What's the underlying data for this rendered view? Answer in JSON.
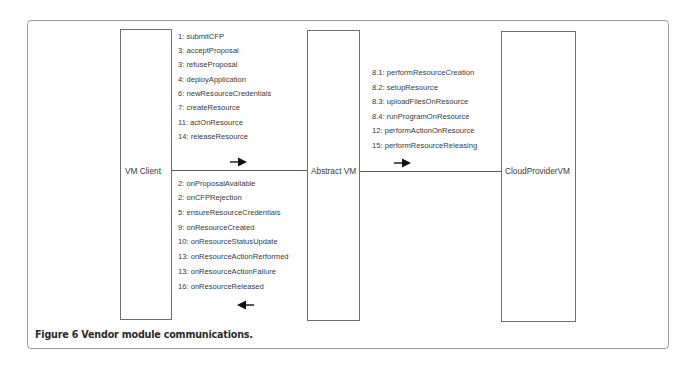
{
  "figure": {
    "caption": "Figure 6 Vendor module communications."
  },
  "components": {
    "vm_client": {
      "label": "VM Client"
    },
    "abstract_vm": {
      "label": "Abstract VM"
    },
    "cloud_provider_vm": {
      "label": "CloudProviderVM"
    }
  },
  "client_to_abstract": {
    "direction": "right",
    "messages": [
      "1: submitCFP",
      "3: acceptProposal",
      "3: refuseProposal",
      "4: deployApplication",
      "6: newResourceCredentials",
      "7: createResource",
      "11: actOnResource",
      "14: releaseResource"
    ]
  },
  "abstract_to_client": {
    "direction": "left",
    "messages": [
      "2: onProposalAvailable",
      "2: onCFPRejection",
      "5: ensureResourceCredentials",
      "9: onResourceCreated",
      "10: onResourceStatusUpdate",
      "13: onResourceActionRerformed",
      "13: onResourceActionFailure",
      "16: onResourceReleased"
    ]
  },
  "abstract_to_cloud": {
    "direction": "right",
    "messages": [
      "8.1: performResourceCreation",
      "8.2: setupResource",
      "8.3: uploadFilesOnResource",
      "8.4: runProgramOnResource",
      "12: performActionOnResource",
      "15: performResourceReleasing"
    ]
  }
}
